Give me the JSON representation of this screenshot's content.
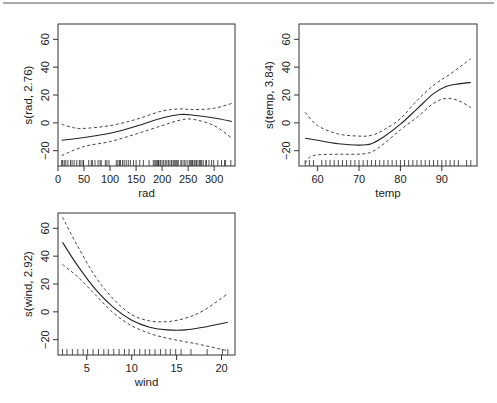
{
  "figure": {
    "width": 497,
    "height": 403,
    "top_rule": true
  },
  "chart_data": [
    {
      "type": "line",
      "title": "",
      "xlabel": "rad",
      "ylabel": "s(rad, 2.76)",
      "xlim": [
        0,
        340
      ],
      "ylim": [
        -31,
        71
      ],
      "xticks": [
        0,
        50,
        100,
        150,
        200,
        250,
        300
      ],
      "yticks": [
        -20,
        0,
        20,
        40,
        60
      ],
      "grid": false,
      "legend": null,
      "frame": {
        "left": 58,
        "top": 24,
        "right": 235,
        "bottom": 166
      },
      "series": [
        {
          "name": "fit",
          "style": "solid",
          "x": [
            7,
            50,
            100,
            150,
            200,
            235,
            260,
            300,
            334
          ],
          "y": [
            -12.5,
            -10.5,
            -7.5,
            -2.5,
            3.5,
            6,
            5.5,
            3.5,
            1
          ]
        },
        {
          "name": "upper CI",
          "style": "dashed",
          "x": [
            7,
            30,
            50,
            100,
            150,
            200,
            235,
            260,
            300,
            334
          ],
          "y": [
            -1,
            -3.5,
            -4,
            -2,
            2.5,
            8.5,
            10,
            9.5,
            10.5,
            14
          ]
        },
        {
          "name": "lower CI",
          "style": "dashed",
          "x": [
            7,
            50,
            100,
            150,
            200,
            235,
            260,
            300,
            334
          ],
          "y": [
            -23.5,
            -17,
            -13.5,
            -8,
            -2,
            2,
            2.5,
            -2,
            -11
          ]
        }
      ],
      "rug": [
        7,
        9,
        12,
        15,
        19,
        24,
        27,
        31,
        36,
        41,
        44,
        48,
        49,
        59,
        64,
        66,
        71,
        77,
        81,
        83,
        91,
        94,
        98,
        112,
        115,
        118,
        120,
        124,
        127,
        131,
        135,
        139,
        145,
        150,
        157,
        164,
        175,
        183,
        186,
        188,
        190,
        192,
        193,
        194,
        197,
        200,
        203,
        206,
        209,
        212,
        215,
        218,
        221,
        223,
        225,
        227,
        229,
        231,
        236,
        238,
        242,
        244,
        248,
        252,
        254,
        256,
        258,
        259,
        262,
        265,
        266,
        269,
        272,
        274,
        276,
        279,
        284,
        285,
        290,
        295,
        299,
        307,
        314,
        320,
        322,
        332
      ]
    },
    {
      "type": "line",
      "title": "",
      "xlabel": "temp",
      "ylabel": "s(temp, 3.84)",
      "xlim": [
        55.5,
        98.5
      ],
      "ylim": [
        -31,
        71
      ],
      "xticks": [
        60,
        70,
        80,
        90
      ],
      "yticks": [
        -20,
        0,
        20,
        40,
        60
      ],
      "grid": false,
      "legend": null,
      "frame": {
        "left": 299,
        "top": 24,
        "right": 477,
        "bottom": 166
      },
      "series": [
        {
          "name": "fit",
          "style": "solid",
          "x": [
            57,
            60,
            65,
            70,
            73,
            76,
            80,
            84,
            88,
            91,
            94,
            97
          ],
          "y": [
            -11,
            -12.5,
            -15,
            -16,
            -15,
            -10,
            -1,
            10,
            21,
            26,
            28,
            29
          ]
        },
        {
          "name": "upper CI",
          "style": "dashed",
          "x": [
            57,
            60,
            65,
            70,
            73,
            76,
            80,
            84,
            88,
            92,
            97
          ],
          "y": [
            7.5,
            -2,
            -8,
            -9.5,
            -9,
            -5,
            3,
            16,
            27,
            35,
            46
          ]
        },
        {
          "name": "lower CI",
          "style": "dashed",
          "x": [
            57,
            58,
            60,
            65,
            70,
            73,
            76,
            80,
            84,
            88,
            91,
            94,
            97
          ],
          "y": [
            -29,
            -25,
            -23,
            -22.5,
            -22.5,
            -21,
            -15,
            -5,
            4,
            14,
            17.5,
            16,
            11
          ]
        }
      ],
      "rug": [
        57,
        58,
        59,
        61,
        62,
        63,
        64,
        65,
        66,
        67,
        68,
        69,
        70,
        71,
        72,
        73,
        74,
        75,
        76,
        77,
        78,
        79,
        80,
        81,
        82,
        83,
        84,
        85,
        86,
        87,
        88,
        89,
        90,
        91,
        92,
        93,
        94,
        96,
        97
      ]
    },
    {
      "type": "line",
      "title": "",
      "xlabel": "wind",
      "ylabel": "s(wind, 2.92)",
      "xlim": [
        1.8,
        21.5
      ],
      "ylim": [
        -31,
        71
      ],
      "xticks": [
        5,
        10,
        15,
        20
      ],
      "yticks": [
        -20,
        0,
        20,
        40,
        60
      ],
      "grid": false,
      "legend": null,
      "frame": {
        "left": 58,
        "top": 213,
        "right": 235,
        "bottom": 355
      },
      "series": [
        {
          "name": "fit",
          "style": "solid",
          "x": [
            2.3,
            4,
            6,
            8,
            10,
            12,
            14,
            16,
            18,
            20.7
          ],
          "y": [
            50,
            33,
            16,
            3,
            -6,
            -11,
            -13,
            -13,
            -11,
            -7.5
          ]
        },
        {
          "name": "upper CI",
          "style": "dashed",
          "x": [
            2.3,
            4,
            6,
            8,
            10,
            12,
            14,
            16,
            18,
            20.7
          ],
          "y": [
            68,
            47,
            25,
            9,
            -2,
            -6.5,
            -7,
            -4.5,
            1,
            13
          ]
        },
        {
          "name": "lower CI",
          "style": "dashed",
          "x": [
            2.3,
            4,
            6,
            8,
            10,
            12,
            14,
            16,
            18,
            20.7
          ],
          "y": [
            34,
            25,
            12,
            -1,
            -10,
            -15.5,
            -19,
            -21.5,
            -24,
            -28
          ]
        }
      ],
      "rug": [
        2.3,
        2.8,
        3.4,
        4.0,
        4.6,
        5.1,
        5.7,
        6.3,
        6.9,
        7.4,
        8.0,
        8.6,
        9.2,
        9.7,
        10.3,
        10.9,
        11.5,
        12.0,
        12.6,
        13.2,
        13.8,
        14.3,
        14.9,
        15.5,
        16.6,
        18.4,
        20.1,
        20.7
      ]
    }
  ]
}
